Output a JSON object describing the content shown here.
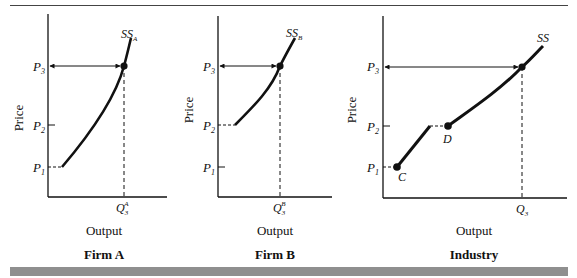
{
  "panels": [
    {
      "id": "firm-a",
      "title": "Firm A",
      "ylabel": "Price",
      "xlabel": "Output",
      "curve_label": "SS",
      "curve_sub": "A",
      "price_ticks": [
        {
          "main": "P",
          "sub": "1"
        },
        {
          "main": "P",
          "sub": "2"
        },
        {
          "main": "P",
          "sub": "3"
        }
      ],
      "q_label": {
        "main": "Q",
        "sub": "3",
        "sup": "A"
      }
    },
    {
      "id": "firm-b",
      "title": "Firm B",
      "ylabel": "Price",
      "xlabel": "Output",
      "curve_label": "SS",
      "curve_sub": "B",
      "price_ticks": [
        {
          "main": "P",
          "sub": "1"
        },
        {
          "main": "P",
          "sub": "2"
        },
        {
          "main": "P",
          "sub": "3"
        }
      ],
      "q_label": {
        "main": "Q",
        "sub": "3",
        "sup": "B"
      }
    },
    {
      "id": "industry",
      "title": "Industry",
      "ylabel": "Price",
      "xlabel": "Output",
      "curve_label": "SS",
      "curve_sub": "",
      "price_ticks": [
        {
          "main": "P",
          "sub": "1"
        },
        {
          "main": "P",
          "sub": "2"
        },
        {
          "main": "P",
          "sub": "3"
        }
      ],
      "q_label": {
        "main": "Q",
        "sub": "3",
        "sup": ""
      },
      "points": [
        {
          "name": "C"
        },
        {
          "name": "D"
        }
      ]
    }
  ],
  "colors": {
    "ink": "#111111",
    "bar": "#8f8f8f"
  }
}
